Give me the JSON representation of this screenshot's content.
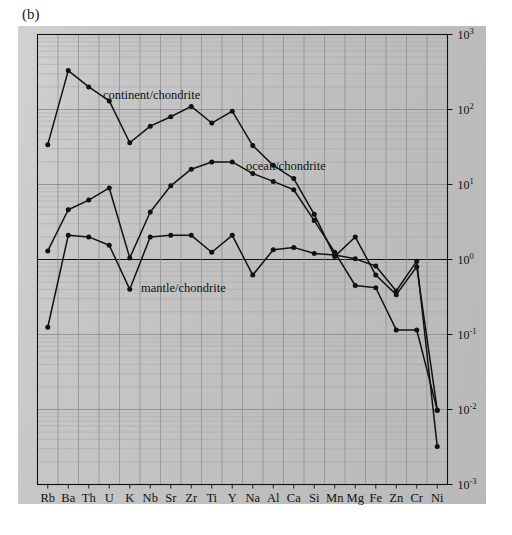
{
  "figure": {
    "panel_label": "(b)",
    "background_color": "#c4c4c4",
    "plot_background": "#ffffff",
    "line_color": "#111111"
  },
  "chart_data": {
    "type": "line",
    "title": "",
    "subtitle": "",
    "xlabel": "",
    "ylabel": "",
    "categories": [
      "Rb",
      "Ba",
      "Th",
      "U",
      "K",
      "Nb",
      "Sr",
      "Zr",
      "Ti",
      "Y",
      "Na",
      "Al",
      "Ca",
      "Si",
      "Mn",
      "Mg",
      "Fe",
      "Zn",
      "Cr",
      "Ni"
    ],
    "yscale": "log",
    "ylim": [
      0.001,
      1000
    ],
    "ytick_labels": [
      "10-3",
      "10-2",
      "10-1",
      "100",
      "101",
      "102",
      "103"
    ],
    "ytick_values": [
      0.001,
      0.01,
      0.1,
      1,
      10,
      100,
      1000
    ],
    "ytick_mantissas": [
      "-3",
      "-2",
      "-1",
      "0",
      "1",
      "2",
      "3"
    ],
    "grid": true,
    "grid_minor": true,
    "legend": "inline-annotations",
    "series": [
      {
        "name": "continent/chondrite",
        "label": "continent/chondrite",
        "label_x": 103,
        "label_y": 99,
        "values": [
          34,
          330,
          200,
          130,
          36,
          60,
          80,
          110,
          66,
          95,
          33,
          18,
          12,
          4.0,
          1.1,
          2.0,
          0.62,
          0.34,
          0.8,
          0.0098
        ]
      },
      {
        "name": "ocean/chondrite",
        "label": "ocean/chondrite",
        "label_x": 246,
        "label_y": 170,
        "values": [
          1.3,
          4.6,
          6.2,
          9.0,
          1.05,
          4.3,
          9.6,
          16,
          20,
          20,
          14,
          11,
          8.5,
          3.3,
          1.25,
          0.45,
          0.42,
          0.115,
          0.115,
          0.0098
        ]
      },
      {
        "name": "mantle/chondrite",
        "label": "mantle/chondrite",
        "label_x": 141,
        "label_y": 292,
        "values": [
          0.125,
          2.1,
          2.0,
          1.55,
          0.4,
          2.0,
          2.1,
          2.1,
          1.25,
          2.1,
          0.62,
          1.35,
          1.45,
          1.2,
          1.15,
          1.02,
          0.82,
          0.38,
          0.95,
          0.0032
        ]
      }
    ]
  }
}
